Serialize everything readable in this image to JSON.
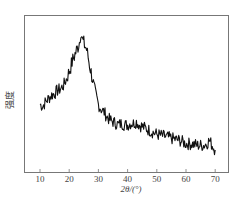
{
  "chart_data": {
    "type": "line",
    "title": "",
    "xlabel": "2θ/(°)",
    "ylabel": "强度",
    "xlim": [
      5,
      75
    ],
    "ylim": [
      0,
      100
    ],
    "x_ticks": [
      10,
      20,
      30,
      40,
      50,
      60,
      70
    ],
    "x_tick_labels": [
      "10",
      "20",
      "30",
      "40",
      "50",
      "60",
      "70"
    ],
    "y_ticks": [],
    "grid": false,
    "legend": null,
    "series": [
      {
        "name": "XRD pattern",
        "color": "#111111",
        "x": [
          10,
          11,
          12,
          13,
          14,
          15,
          16,
          17,
          18,
          19,
          20,
          21,
          22,
          23,
          23.5,
          24,
          24.5,
          25,
          26,
          27,
          28,
          29,
          30,
          31,
          32,
          33,
          34,
          35,
          36,
          37,
          38,
          39,
          40,
          41,
          42,
          43,
          44,
          45,
          46,
          47,
          48,
          49,
          50,
          52,
          54,
          56,
          58,
          60,
          62,
          64,
          66,
          67,
          68,
          69,
          70
        ],
        "values": [
          43,
          42,
          45,
          47,
          49,
          50,
          52,
          53,
          55,
          59,
          64,
          70,
          75,
          80,
          83,
          90,
          84,
          82,
          78,
          68,
          59,
          50,
          43,
          40,
          38,
          35,
          33,
          32,
          31,
          30,
          31,
          30,
          30,
          31,
          31,
          32,
          30,
          29,
          28,
          27,
          26,
          25,
          24,
          23,
          22,
          21,
          20,
          18,
          18,
          17,
          17,
          18,
          20,
          17,
          14
        ]
      }
    ]
  },
  "axes": {
    "xlabel": "2θ/(°)",
    "ylabel": "强度",
    "ticks": [
      "10",
      "20",
      "30",
      "40",
      "50",
      "60",
      "70"
    ]
  }
}
